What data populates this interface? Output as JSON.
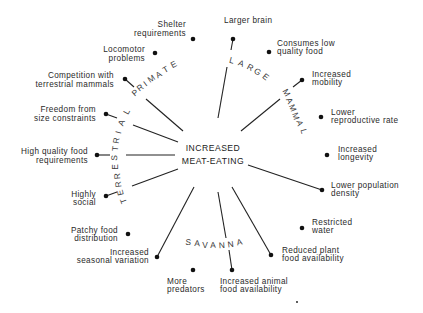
{
  "center": {
    "line1": "INCREASED",
    "line2": "MEAT-EATING"
  },
  "categories": {
    "primate": "PRIMATE",
    "large": "LARGE",
    "mammal": "MAMMAL",
    "terrestrial": "TERRESTRIAL",
    "savanna": "SAVANNA"
  },
  "factors": {
    "shelter": [
      "Shelter",
      "requirements"
    ],
    "locomotor": [
      "Locomotor",
      "problems"
    ],
    "competition": [
      "Competition with",
      "terrestrial mammals"
    ],
    "freedom": [
      "Freedom from",
      "size constraints"
    ],
    "high_quality": [
      "High quality food",
      "requirements"
    ],
    "highly_social": [
      "Highly",
      "social"
    ],
    "patchy": [
      "Patchy food",
      "distribution"
    ],
    "seasonal": [
      "Increased",
      "seasonal variation"
    ],
    "predators": [
      "More",
      "predators"
    ],
    "animal_food": [
      "Increased animal",
      "food availability"
    ],
    "plant_food": [
      "Reduced plant",
      "food availability"
    ],
    "water": [
      "Restricted",
      "water"
    ],
    "population": [
      "Lower population",
      "density"
    ],
    "longevity": [
      "Increased",
      "longevity"
    ],
    "reproductive": [
      "Lower",
      "reproductive rate"
    ],
    "mobility": [
      "Increased",
      "mobility"
    ],
    "consumes": [
      "Consumes low",
      "quality food"
    ],
    "brain": [
      "Larger brain"
    ]
  },
  "colors": {
    "ink": "#222222",
    "background": "#ffffff"
  }
}
